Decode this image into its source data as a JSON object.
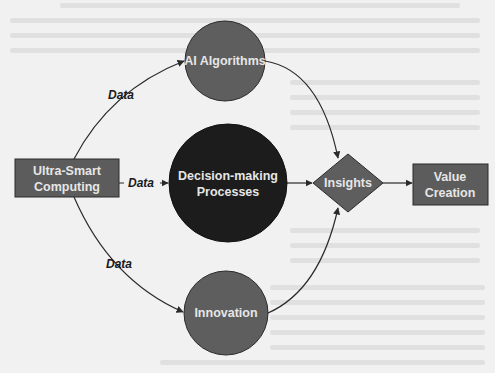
{
  "diagram": {
    "type": "flow",
    "nodes": [
      {
        "id": "ultra_smart_computing",
        "label_lines": [
          "Ultra-Smart",
          "Computing"
        ],
        "shape": "rectangle",
        "fill": "#5c5c5c"
      },
      {
        "id": "ai_algorithms",
        "label_lines": [
          "AI Algorithms"
        ],
        "shape": "circle",
        "fill": "#5e5e5e"
      },
      {
        "id": "decision_making",
        "label_lines": [
          "Decision-making",
          "Processes"
        ],
        "shape": "circle",
        "fill": "#1c1c1c"
      },
      {
        "id": "innovation",
        "label_lines": [
          "Innovation"
        ],
        "shape": "circle",
        "fill": "#5e5e5e"
      },
      {
        "id": "insights",
        "label_lines": [
          "Insights"
        ],
        "shape": "diamond",
        "fill": "#5e5e5e"
      },
      {
        "id": "value_creation",
        "label_lines": [
          "Value",
          "Creation"
        ],
        "shape": "rectangle",
        "fill": "#5c5c5c"
      }
    ],
    "edges": [
      {
        "from": "ultra_smart_computing",
        "to": "ai_algorithms",
        "label": "Data"
      },
      {
        "from": "ultra_smart_computing",
        "to": "decision_making",
        "label": "Data"
      },
      {
        "from": "ultra_smart_computing",
        "to": "innovation",
        "label": "Data"
      },
      {
        "from": "ai_algorithms",
        "to": "insights",
        "label": ""
      },
      {
        "from": "decision_making",
        "to": "insights",
        "label": ""
      },
      {
        "from": "innovation",
        "to": "insights",
        "label": ""
      },
      {
        "from": "insights",
        "to": "value_creation",
        "label": ""
      }
    ]
  },
  "labels": {
    "ultra_line1": "Ultra-Smart",
    "ultra_line2": "Computing",
    "ai": "AI Algorithms",
    "decision_line1": "Decision-making",
    "decision_line2": "Processes",
    "innovation": "Innovation",
    "insights": "Insights",
    "value_line1": "Value",
    "value_line2": "Creation",
    "edge_data_top": "Data",
    "edge_data_mid": "Data",
    "edge_data_bottom": "Data"
  },
  "colors": {
    "background": "#f1f1f1",
    "node_gray": "#5e5e5e",
    "node_dark": "#1c1c1c",
    "node_text": "#e6e6e6",
    "edge": "#2a2a2a"
  }
}
